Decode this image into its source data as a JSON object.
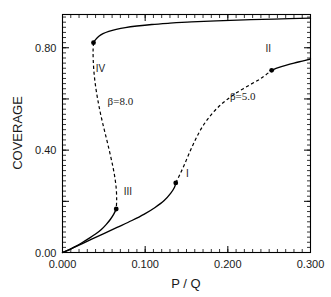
{
  "chart_data": {
    "type": "line",
    "title": "",
    "xlabel": "P / Q",
    "ylabel": "COVERAGE",
    "xlim": [
      0.0,
      0.3
    ],
    "ylim": [
      0.0,
      0.93
    ],
    "grid": false,
    "legend": "none",
    "x_major_ticks": [
      "0.000",
      "0.100",
      "0.200",
      "0.300"
    ],
    "x_major_values": [
      0.0,
      0.1,
      0.2,
      0.3
    ],
    "x_minor_step": 0.01,
    "y_major_ticks": [
      "0.00",
      "0.40",
      "0.80"
    ],
    "y_major_values": [
      0.0,
      0.4,
      0.8
    ],
    "y_minor_step": 0.02,
    "annotations": [
      {
        "text": "IV",
        "x": 0.046,
        "y": 0.705
      },
      {
        "text": "III",
        "x": 0.079,
        "y": 0.225
      },
      {
        "text": "I",
        "x": 0.151,
        "y": 0.295
      },
      {
        "text": "II",
        "x": 0.249,
        "y": 0.785
      },
      {
        "text": "β=8.0",
        "x": 0.07,
        "y": 0.575
      },
      {
        "text": "β=5.0",
        "x": 0.218,
        "y": 0.595
      }
    ],
    "markers": [
      {
        "name": "point-IV",
        "x": 0.0375,
        "y": 0.82
      },
      {
        "name": "point-III",
        "x": 0.065,
        "y": 0.17
      },
      {
        "name": "point-I",
        "x": 0.137,
        "y": 0.272
      },
      {
        "name": "point-II",
        "x": 0.253,
        "y": 0.712
      }
    ],
    "series": [
      {
        "name": "beta-8.0-upper-stable",
        "beta": 8.0,
        "style": "solid",
        "points": [
          [
            0.0375,
            0.82
          ],
          [
            0.04,
            0.832
          ],
          [
            0.044,
            0.845
          ],
          [
            0.049,
            0.855
          ],
          [
            0.056,
            0.864
          ],
          [
            0.065,
            0.872
          ],
          [
            0.076,
            0.879
          ],
          [
            0.09,
            0.885
          ],
          [
            0.108,
            0.891
          ],
          [
            0.13,
            0.896
          ],
          [
            0.156,
            0.901
          ],
          [
            0.186,
            0.905
          ],
          [
            0.22,
            0.909
          ],
          [
            0.256,
            0.912
          ],
          [
            0.3,
            0.916
          ]
        ]
      },
      {
        "name": "beta-8.0-unstable",
        "beta": 8.0,
        "style": "dashed",
        "points": [
          [
            0.0375,
            0.82
          ],
          [
            0.037,
            0.79
          ],
          [
            0.0372,
            0.75
          ],
          [
            0.0382,
            0.7
          ],
          [
            0.04,
            0.65
          ],
          [
            0.0425,
            0.6
          ],
          [
            0.0455,
            0.55
          ],
          [
            0.049,
            0.5
          ],
          [
            0.0528,
            0.45
          ],
          [
            0.0565,
            0.4
          ],
          [
            0.06,
            0.35
          ],
          [
            0.063,
            0.3
          ],
          [
            0.065,
            0.25
          ],
          [
            0.0655,
            0.205
          ],
          [
            0.065,
            0.17
          ]
        ]
      },
      {
        "name": "beta-8.0-lower-stable",
        "beta": 8.0,
        "style": "solid",
        "points": [
          [
            0.065,
            0.17
          ],
          [
            0.062,
            0.15
          ],
          [
            0.058,
            0.13
          ],
          [
            0.053,
            0.11
          ],
          [
            0.047,
            0.09
          ],
          [
            0.04,
            0.072
          ],
          [
            0.032,
            0.055
          ],
          [
            0.024,
            0.039
          ],
          [
            0.0165,
            0.025
          ],
          [
            0.01,
            0.014
          ],
          [
            0.005,
            0.006
          ],
          [
            0.002,
            0.002
          ],
          [
            0.0,
            0.0
          ]
        ]
      },
      {
        "name": "beta-5.0-lower-stable",
        "beta": 5.0,
        "style": "solid",
        "points": [
          [
            0.0,
            0.0
          ],
          [
            0.006,
            0.008
          ],
          [
            0.014,
            0.02
          ],
          [
            0.024,
            0.035
          ],
          [
            0.036,
            0.053
          ],
          [
            0.05,
            0.074
          ],
          [
            0.066,
            0.098
          ],
          [
            0.084,
            0.125
          ],
          [
            0.099,
            0.15
          ],
          [
            0.112,
            0.176
          ],
          [
            0.123,
            0.203
          ],
          [
            0.131,
            0.232
          ],
          [
            0.1355,
            0.255
          ],
          [
            0.137,
            0.272
          ]
        ]
      },
      {
        "name": "beta-5.0-unstable",
        "beta": 5.0,
        "style": "dashed",
        "points": [
          [
            0.137,
            0.272
          ],
          [
            0.142,
            0.305
          ],
          [
            0.147,
            0.34
          ],
          [
            0.152,
            0.378
          ],
          [
            0.157,
            0.415
          ],
          [
            0.1625,
            0.452
          ],
          [
            0.169,
            0.49
          ],
          [
            0.177,
            0.527
          ],
          [
            0.1865,
            0.562
          ],
          [
            0.198,
            0.595
          ],
          [
            0.211,
            0.625
          ],
          [
            0.226,
            0.654
          ],
          [
            0.24,
            0.68
          ],
          [
            0.253,
            0.712
          ]
        ]
      },
      {
        "name": "beta-5.0-upper-stable",
        "beta": 5.0,
        "style": "solid",
        "points": [
          [
            0.253,
            0.712
          ],
          [
            0.261,
            0.722
          ],
          [
            0.27,
            0.731
          ],
          [
            0.28,
            0.74
          ],
          [
            0.29,
            0.748
          ],
          [
            0.3,
            0.756
          ]
        ]
      }
    ]
  },
  "colors": {
    "axis": "#000000",
    "curve": "#000000",
    "background": "#ffffff"
  }
}
